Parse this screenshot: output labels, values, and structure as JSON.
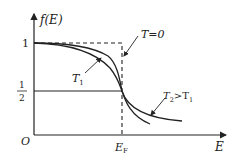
{
  "diagram": {
    "y_axis_label": "f(E)",
    "x_axis_label": "E",
    "origin_label": "O",
    "y_tick_one": "1",
    "y_tick_half_num": "1",
    "y_tick_half_den": "2",
    "x_tick_fermi": "E",
    "x_tick_fermi_sub": "F",
    "curves": [
      {
        "name": "T=0",
        "label": "T=0",
        "style": "dashed",
        "description": "step function at E_F"
      },
      {
        "name": "T1",
        "label": "T",
        "label_sub": "1",
        "style": "solid"
      },
      {
        "name": "T2",
        "label": "T",
        "label_sub": "2",
        "label_rest": ">T",
        "label_rest_sub": "1",
        "style": "solid"
      }
    ],
    "colors": {
      "line": "#222222",
      "background": "#ffffff"
    }
  }
}
